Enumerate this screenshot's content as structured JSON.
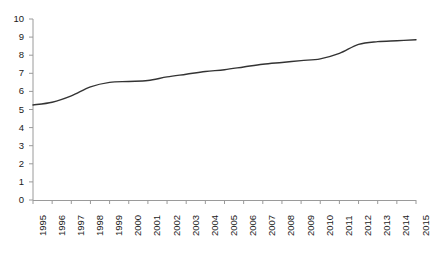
{
  "chart_data": {
    "type": "line",
    "title": "",
    "subtitle": "",
    "xlabel": "",
    "ylabel": "",
    "legend": [],
    "grid": false,
    "legend_position": "none",
    "line_color": "#333333",
    "axis_color": "#9a9a9a",
    "categories": [
      "1995",
      "1996",
      "1997",
      "1998",
      "1999",
      "2000",
      "2001",
      "2002",
      "2003",
      "2004",
      "2005",
      "2006",
      "2007",
      "2008",
      "2009",
      "2010",
      "2011",
      "2012",
      "2013",
      "2014",
      "2015"
    ],
    "x": [
      1995,
      1996,
      1997,
      1998,
      1999,
      2000,
      2001,
      2002,
      2003,
      2004,
      2005,
      2006,
      2007,
      2008,
      2009,
      2010,
      2011,
      2012,
      2013,
      2014,
      2015
    ],
    "values": [
      5.25,
      5.4,
      5.75,
      6.25,
      6.5,
      6.55,
      6.6,
      6.8,
      6.95,
      7.1,
      7.2,
      7.35,
      7.5,
      7.6,
      7.7,
      7.8,
      8.1,
      8.6,
      8.75,
      8.8,
      8.85
    ],
    "series": [
      {
        "name": "",
        "values": [
          5.25,
          5.4,
          5.75,
          6.25,
          6.5,
          6.55,
          6.6,
          6.8,
          6.95,
          7.1,
          7.2,
          7.35,
          7.5,
          7.6,
          7.7,
          7.8,
          8.1,
          8.6,
          8.75,
          8.8,
          8.85
        ]
      }
    ],
    "xlim": [
      1995,
      2015
    ],
    "ylim": [
      0,
      10
    ],
    "y_ticks": [
      "0",
      "1",
      "2",
      "3",
      "4",
      "5",
      "6",
      "7",
      "8",
      "9",
      "10"
    ],
    "y_tick_values": [
      0,
      1,
      2,
      3,
      4,
      5,
      6,
      7,
      8,
      9,
      10
    ],
    "x_ticks": [
      "1995",
      "1996",
      "1997",
      "1998",
      "1999",
      "2000",
      "2001",
      "2002",
      "2003",
      "2004",
      "2005",
      "2006",
      "2007",
      "2008",
      "2009",
      "2010",
      "2011",
      "2012",
      "2013",
      "2014",
      "2015"
    ]
  }
}
